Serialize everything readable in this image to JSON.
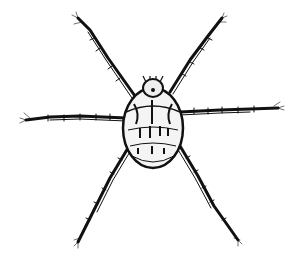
{
  "image": {
    "subject": "mite illustration",
    "style": "black ink line drawing",
    "background": "#ffffff",
    "ink": "#111111",
    "legs": 6
  }
}
